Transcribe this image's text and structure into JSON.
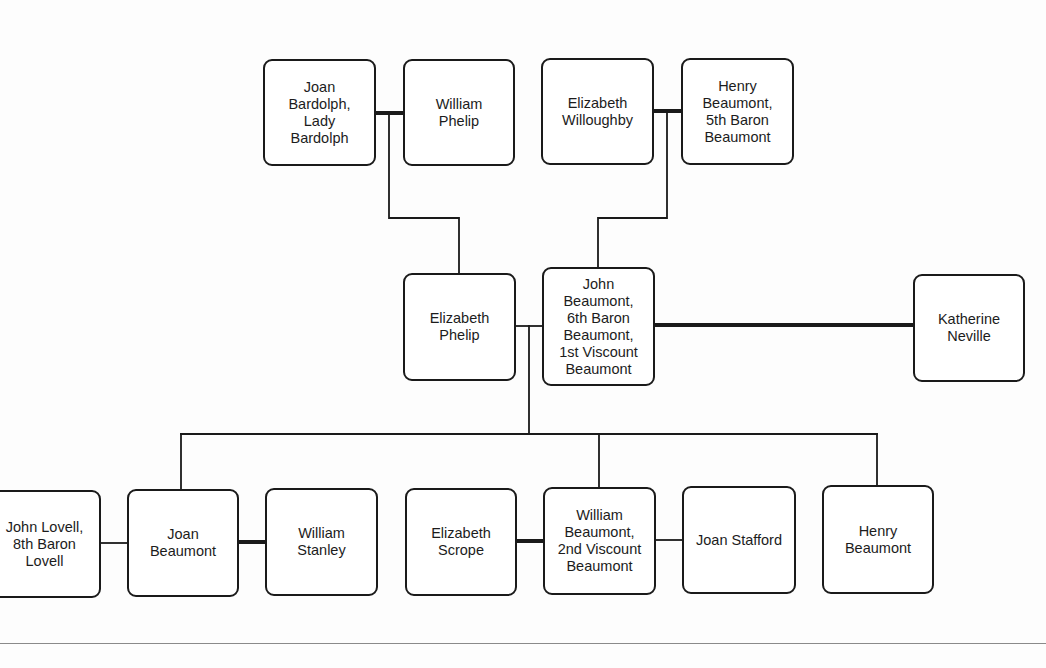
{
  "diagram": {
    "type": "family-tree",
    "persons": [
      {
        "id": "joan_bardolph",
        "name": "Joan\nBardolph,\nLady\nBardolph",
        "x": 263,
        "y": 59,
        "w": 113,
        "h": 107
      },
      {
        "id": "william_phelip",
        "name": "William\nPhelip",
        "x": 403,
        "y": 59,
        "w": 112,
        "h": 107
      },
      {
        "id": "elizabeth_willoughby",
        "name": "Elizabeth\nWilloughby",
        "x": 541,
        "y": 58,
        "w": 113,
        "h": 107
      },
      {
        "id": "henry_beaumont_5th_baron",
        "name": "Henry\nBeaumont,\n5th Baron\nBeaumont",
        "x": 681,
        "y": 58,
        "w": 113,
        "h": 107
      },
      {
        "id": "elizabeth_phelip",
        "name": "Elizabeth\nPhelip",
        "x": 403,
        "y": 273,
        "w": 113,
        "h": 108
      },
      {
        "id": "john_beaumont_1st_viscount",
        "name": "John\nBeaumont,\n6th Baron\nBeaumont,\n1st Viscount\nBeaumont",
        "x": 542,
        "y": 267,
        "w": 113,
        "h": 119
      },
      {
        "id": "katherine_neville",
        "name": "Katherine\nNeville",
        "x": 913,
        "y": 274,
        "w": 112,
        "h": 108
      },
      {
        "id": "john_lovell_8th_baron",
        "name": "John Lovell,\n8th Baron\nLovell",
        "x": -12,
        "y": 490,
        "w": 113,
        "h": 108
      },
      {
        "id": "joan_beaumont",
        "name": "Joan\nBeaumont",
        "x": 127,
        "y": 489,
        "w": 112,
        "h": 108
      },
      {
        "id": "william_stanley",
        "name": "William\nStanley",
        "x": 265,
        "y": 488,
        "w": 113,
        "h": 108
      },
      {
        "id": "elizabeth_scrope",
        "name": "Elizabeth\nScrope",
        "x": 405,
        "y": 488,
        "w": 112,
        "h": 108
      },
      {
        "id": "william_beaumont_2nd_viscount",
        "name": "William\nBeaumont,\n2nd Viscount\nBeaumont",
        "x": 543,
        "y": 487,
        "w": 113,
        "h": 108
      },
      {
        "id": "joan_stafford",
        "name": "Joan Stafford",
        "x": 682,
        "y": 486,
        "w": 114,
        "h": 108
      },
      {
        "id": "henry_beaumont",
        "name": "Henry\nBeaumont",
        "x": 822,
        "y": 485,
        "w": 112,
        "h": 109
      }
    ],
    "marriages": [
      {
        "a": "joan_bardolph",
        "b": "william_phelip",
        "style": "thick"
      },
      {
        "a": "elizabeth_willoughby",
        "b": "henry_beaumont_5th_baron",
        "style": "thick"
      },
      {
        "a": "elizabeth_phelip",
        "b": "john_beaumont_1st_viscount",
        "style": "thin"
      },
      {
        "a": "john_beaumont_1st_viscount",
        "b": "katherine_neville",
        "style": "thick"
      },
      {
        "a": "john_lovell_8th_baron",
        "b": "joan_beaumont",
        "style": "thin"
      },
      {
        "a": "joan_beaumont",
        "b": "william_stanley",
        "style": "thick"
      },
      {
        "a": "elizabeth_scrope",
        "b": "william_beaumont_2nd_viscount",
        "style": "thick"
      },
      {
        "a": "william_beaumont_2nd_viscount",
        "b": "joan_stafford",
        "style": "thin"
      }
    ],
    "descents": [
      {
        "parents": [
          "joan_bardolph",
          "william_phelip"
        ],
        "children": [
          "elizabeth_phelip"
        ]
      },
      {
        "parents": [
          "elizabeth_willoughby",
          "henry_beaumont_5th_baron"
        ],
        "children": [
          "john_beaumont_1st_viscount"
        ]
      },
      {
        "parents": [
          "elizabeth_phelip",
          "john_beaumont_1st_viscount"
        ],
        "children": [
          "joan_beaumont",
          "william_beaumont_2nd_viscount",
          "henry_beaumont"
        ]
      }
    ]
  },
  "colors": {
    "line": "#1a1a1a",
    "box_border": "#1a1a1a",
    "background": "#fdfdfd",
    "footer_rule": "#8a8a8a"
  }
}
